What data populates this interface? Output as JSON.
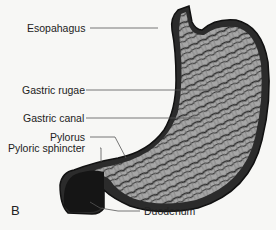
{
  "figure": {
    "panel_letter": "B",
    "labels": [
      {
        "id": "esophagus",
        "text": "Esopahagus"
      },
      {
        "id": "gastric-rugae",
        "text": "Gastric rugae"
      },
      {
        "id": "gastric-canal",
        "text": "Gastric canal"
      },
      {
        "id": "pylorus",
        "text": "Pylorus"
      },
      {
        "id": "pyloric-sphincter",
        "text": "Pyloric sphincter"
      },
      {
        "id": "duodenum",
        "text": "Duodenum"
      }
    ],
    "colors": {
      "background": "#f7f7f5",
      "outline": "#1a1a1a",
      "wall_dark": "#2b2b2b",
      "rugae_light": "#a8a8a8",
      "leader_line": "#555555"
    }
  }
}
